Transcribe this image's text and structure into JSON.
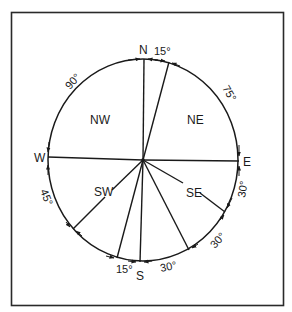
{
  "diagram": {
    "type": "compass-sector-diagram",
    "colors": {
      "line": "#1a1a1a",
      "frame": "#2a2a2a",
      "background": "#ffffff"
    },
    "cardinal_labels": {
      "north": "N",
      "east": "E",
      "south": "S",
      "west": "W"
    },
    "sector_labels": {
      "nw": "NW",
      "ne": "NE",
      "sw": "SW",
      "se": "SE"
    },
    "angle_labels": {
      "n_ne": "15°",
      "ne_e": "75°",
      "e_se1": "30°",
      "se1_se2": "30°",
      "se2_s": "30°",
      "s_sw1": "15°",
      "sw1_sw2": "45°",
      "w_n": "90°"
    }
  }
}
